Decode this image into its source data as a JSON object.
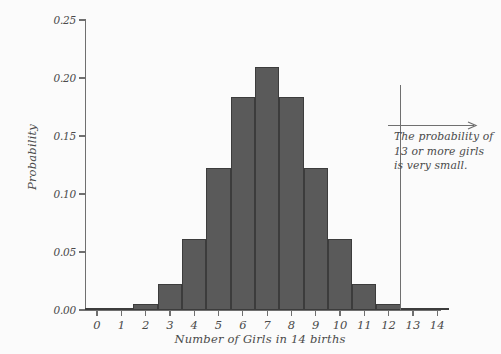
{
  "chart_data": {
    "type": "bar",
    "title": "",
    "subtitle": "",
    "xlabel": "Number of Girls in 14 births",
    "ylabel": "Probability",
    "categories": [
      "0",
      "1",
      "2",
      "3",
      "4",
      "5",
      "6",
      "7",
      "8",
      "9",
      "10",
      "11",
      "12",
      "13",
      "14"
    ],
    "values": [
      0.0001,
      0.0009,
      0.0056,
      0.0222,
      0.0611,
      0.1222,
      0.1833,
      0.2095,
      0.1833,
      0.1222,
      0.0611,
      0.0222,
      0.0056,
      0.0009,
      0.0001
    ],
    "series": [
      {
        "name": "Probability",
        "values": [
          0.0001,
          0.0009,
          0.0056,
          0.0222,
          0.0611,
          0.1222,
          0.1833,
          0.2095,
          0.1833,
          0.1222,
          0.0611,
          0.0222,
          0.0056,
          0.0009,
          0.0001
        ]
      }
    ],
    "ylim": [
      0.0,
      0.25
    ],
    "ytick_values": [
      0.0,
      0.05,
      0.1,
      0.15,
      0.2,
      0.25
    ],
    "ytick_labels": [
      "0.00",
      "0.05",
      "0.10",
      "0.15",
      "0.20",
      "0.25"
    ],
    "xtick_labels": [
      "0",
      "1",
      "2",
      "3",
      "4",
      "5",
      "6",
      "7",
      "8",
      "9",
      "10",
      "11",
      "12",
      "13",
      "14"
    ],
    "grid": false,
    "legend": false,
    "legend_position": "none",
    "bar_color": "#5a5a5a",
    "bar_edge_color": "#3c3c3c",
    "axis_color": "#6f6f6f",
    "background_color": "#fbfbfb",
    "annotations": [
      {
        "kind": "vline",
        "x": 12.5,
        "label": "cutoff-line"
      },
      {
        "kind": "arrow",
        "direction": "right",
        "label": "annotation-arrow"
      },
      {
        "kind": "text",
        "lines": [
          "The probability of",
          "13 or more girls",
          "is very small."
        ]
      }
    ]
  },
  "annotation": {
    "line1": "The probability of",
    "line2": "13 or more girls",
    "line3": "is very small."
  }
}
